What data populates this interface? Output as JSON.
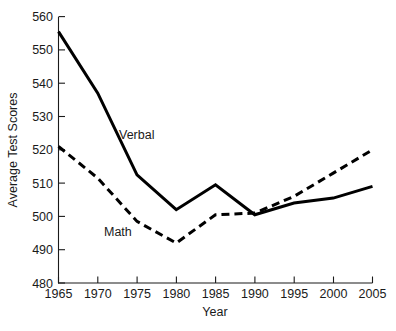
{
  "chart_data": {
    "type": "line",
    "title": "",
    "xlabel": "Year",
    "ylabel": "Average Test Scores",
    "x": [
      1965,
      1970,
      1975,
      1980,
      1985,
      1990,
      1995,
      2000,
      2005
    ],
    "xticklabels": [
      "1965",
      "1970",
      "1975",
      "1980",
      "1985",
      "1990",
      "1995",
      "2000",
      "2005"
    ],
    "yticklabels": [
      "480",
      "490",
      "500",
      "510",
      "520",
      "530",
      "540",
      "550",
      "560"
    ],
    "yticks": [
      480,
      490,
      500,
      510,
      520,
      530,
      540,
      550,
      560
    ],
    "xlim": [
      1965,
      2005
    ],
    "ylim": [
      480,
      560
    ],
    "grid": false,
    "legend_position": "inline-annotation",
    "series": [
      {
        "name": "Verbal",
        "style": "solid",
        "color": "#000000",
        "values": [
          555.5,
          537.0,
          512.5,
          502.0,
          509.5,
          500.5,
          504.0,
          505.5,
          509.0
        ]
      },
      {
        "name": "Math",
        "style": "dashed",
        "color": "#000000",
        "values": [
          521.0,
          511.5,
          498.5,
          492.0,
          500.5,
          501.0,
          506.0,
          513.0,
          520.0
        ]
      }
    ],
    "annotations": [
      {
        "text": "Verbal",
        "x": 1976.5,
        "y": 524.5
      },
      {
        "text": "Math",
        "x": 1972.5,
        "y": 496.5
      }
    ]
  }
}
